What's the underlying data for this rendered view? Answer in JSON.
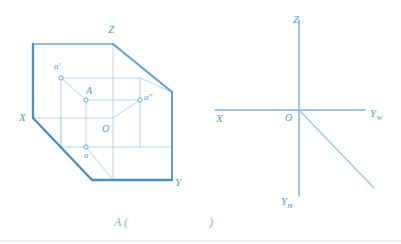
{
  "figure": {
    "title_caption": {
      "prefix": "A (",
      "suffix": ")"
    },
    "stroke_colors": {
      "outline_heavy": "#4a90c4",
      "outline_light": "#8cc0e3",
      "inner_line": "#9ccbe8",
      "axis": "#7fb4da",
      "label": "#5b9bd5"
    }
  },
  "left_diagram": {
    "name": "pictorial-projection-planes",
    "labels": {
      "z_axis": "Z",
      "x_axis": "X",
      "y_axis": "Y",
      "origin": "O",
      "point_space": "A",
      "point_v_projection": "a'",
      "point_h_projection": "a",
      "point_w_projection": "a\""
    }
  },
  "right_diagram": {
    "name": "orthographic-axis-system",
    "labels": {
      "z_axis": "Z",
      "x_axis": "X",
      "yw_axis_main": "Y",
      "yw_axis_sub": "W",
      "yh_axis_main": "Y",
      "yh_axis_sub": "H",
      "origin": "O"
    }
  },
  "geometry": {
    "left": {
      "outline": "33,44 113,44 172,92 172,180 92,180 33,118",
      "inner_top_back": "61,78 140,78",
      "inner_v_left": "61,78 61,147",
      "inner_diag_a_prime": "61,78 86,100",
      "inner_top_front": "86,100 140,100",
      "inner_A_vert": "86,100 86,147",
      "inner_bottom_front": "86,147 140,147",
      "inner_right_vert": "140,100 140,147",
      "inner_diag_right": "140,78 140,100",
      "inner_diag_origin": "113,118 140,100",
      "inner_back_top_v": "113,44 113,118",
      "inner_origin_left": "61,118 113,118",
      "inner_origin_bottom": "113,118 113,180",
      "inner_diag_low": "33,118 61,118",
      "inner_diag_a": "61,147 86,147",
      "inner_diag_corner": "92,180 113,180",
      "inner_diag_right_low": "140,147 172,147",
      "inner_diag_right_top": "140,78 172,92"
    },
    "right": {
      "z_axis": "299,20 299,110",
      "x_axis": "215,110 299,110",
      "yw_axis": "299,110 365,110",
      "yh_axis": "299,110 299,196",
      "diagonal": "299,110 374,188"
    }
  }
}
